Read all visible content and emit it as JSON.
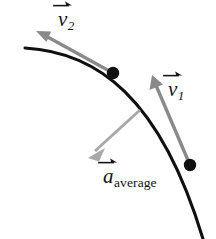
{
  "figure": {
    "name": "velocity-average-acceleration-curve",
    "background_color": "#ffffff",
    "width": 216,
    "height": 239
  },
  "labels": {
    "v2": {
      "symbol": "v",
      "subscript": "2",
      "full_text": "v⃗₂",
      "color": "#141414"
    },
    "v1": {
      "symbol": "v",
      "subscript": "1",
      "full_text": "v⃗₁",
      "color": "#141414"
    },
    "a_average": {
      "symbol": "a",
      "subscript": "average",
      "full_text": "a⃗ average",
      "color": "#141414"
    }
  },
  "colors": {
    "trajectory": "#101010",
    "velocity_vector": "#8a8a8a",
    "acceleration_vector": "#a8a8a8",
    "point_marker": "#101010",
    "label_text": "#141414"
  },
  "chart_data": {
    "type": "scatter",
    "title": "",
    "xlabel": "",
    "ylabel": "",
    "trajectory": {
      "name": "curved-path",
      "color": "#101010",
      "start": [
        25,
        48
      ],
      "control_1": [
        96,
        52
      ],
      "control_2": [
        160,
        96
      ],
      "end": [
        203,
        239
      ]
    },
    "points": [
      {
        "name": "point-2",
        "label": "position 2",
        "x": 113,
        "y": 73,
        "radius": 6
      },
      {
        "name": "point-1",
        "label": "position 1",
        "x": 190,
        "y": 165,
        "radius": 6
      }
    ],
    "vectors": [
      {
        "name": "v2",
        "label": "v⃗₂",
        "color": "#8a8a8a",
        "tail": [
          113,
          73
        ],
        "tip": [
          36,
          31
        ],
        "width": 3.2
      },
      {
        "name": "v1",
        "label": "v⃗₁",
        "color": "#8a8a8a",
        "tail": [
          190,
          165
        ],
        "tip": [
          152,
          75
        ],
        "width": 3.2
      },
      {
        "name": "a_average",
        "label": "a⃗ average",
        "color": "#a8a8a8",
        "tail": [
          140,
          110
        ],
        "tip": [
          88,
          158
        ],
        "width": 2.8
      }
    ],
    "legend_position": "none",
    "grid": false
  }
}
